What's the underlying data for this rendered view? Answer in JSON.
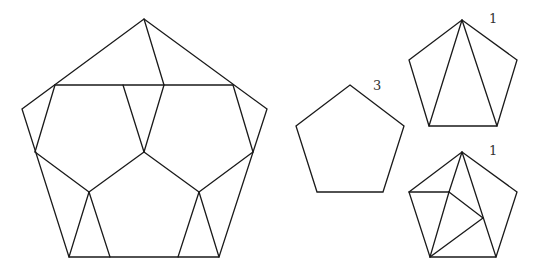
{
  "figures": [
    {
      "id": "large-dissected-pentagon",
      "outline": [
        [
          144,
          19
        ],
        [
          267,
          109
        ],
        [
          219,
          257
        ],
        [
          69,
          257
        ],
        [
          22,
          109
        ]
      ],
      "segments": [
        [
          [
            55,
            85
          ],
          [
            233,
            85
          ]
        ],
        [
          [
            144,
            19
          ],
          [
            164,
            85
          ]
        ],
        [
          [
            55,
            85
          ],
          [
            35,
            152
          ]
        ],
        [
          [
            233,
            85
          ],
          [
            253,
            152
          ]
        ],
        [
          [
            123,
            85
          ],
          [
            144,
            152
          ]
        ],
        [
          [
            164,
            85
          ],
          [
            144,
            152
          ]
        ],
        [
          [
            35,
            152
          ],
          [
            89,
            192
          ]
        ],
        [
          [
            253,
            152
          ],
          [
            199,
            192
          ]
        ],
        [
          [
            144,
            152
          ],
          [
            89,
            192
          ]
        ],
        [
          [
            144,
            152
          ],
          [
            199,
            192
          ]
        ],
        [
          [
            89,
            192
          ],
          [
            69,
            257
          ]
        ],
        [
          [
            89,
            192
          ],
          [
            110,
            257
          ]
        ],
        [
          [
            199,
            192
          ],
          [
            178,
            257
          ]
        ],
        [
          [
            199,
            192
          ],
          [
            219,
            257
          ]
        ]
      ],
      "label": ""
    },
    {
      "id": "plain-pentagon",
      "outline": [
        [
          350,
          85
        ],
        [
          404,
          126
        ],
        [
          383,
          192
        ],
        [
          317,
          192
        ],
        [
          296,
          126
        ]
      ],
      "segments": [],
      "label": "3",
      "label_pos": [
        373,
        90
      ]
    },
    {
      "id": "fan-triangulated-pentagon",
      "outline": [
        [
          462,
          20
        ],
        [
          517,
          60
        ],
        [
          497,
          126
        ],
        [
          429,
          126
        ],
        [
          409,
          60
        ]
      ],
      "segments": [
        [
          [
            462,
            20
          ],
          [
            429,
            126
          ]
        ],
        [
          [
            462,
            20
          ],
          [
            497,
            126
          ]
        ]
      ],
      "label": "1",
      "label_pos": [
        489,
        23
      ]
    },
    {
      "id": "subdivided-pentagon",
      "outline": [
        [
          462,
          152
        ],
        [
          517,
          192
        ],
        [
          496,
          257
        ],
        [
          430,
          257
        ],
        [
          409,
          192
        ]
      ],
      "segments": [
        [
          [
            409,
            192
          ],
          [
            449,
            192
          ]
        ],
        [
          [
            462,
            152
          ],
          [
            449,
            192
          ]
        ],
        [
          [
            449,
            192
          ],
          [
            430,
            257
          ]
        ],
        [
          [
            462,
            152
          ],
          [
            496,
            257
          ]
        ],
        [
          [
            449,
            192
          ],
          [
            483,
            218
          ]
        ],
        [
          [
            483,
            218
          ],
          [
            430,
            257
          ]
        ]
      ],
      "label": "1",
      "label_pos": [
        489,
        155
      ]
    }
  ],
  "colors": {
    "stroke": "#1a1a1a",
    "label": "#333333",
    "background": "#ffffff"
  }
}
